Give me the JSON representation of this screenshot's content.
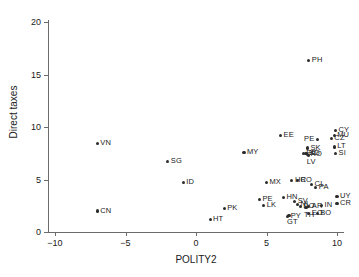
{
  "chart_data": {
    "type": "scatter",
    "title": "",
    "xlabel": "POLITY2",
    "ylabel": "Direct taxes",
    "xlim": [
      -10,
      10
    ],
    "ylim": [
      0,
      20
    ],
    "xticks": [
      "-10",
      "-5",
      "0",
      "5",
      "10"
    ],
    "xtick_values": [
      -10,
      -5,
      0,
      5,
      10
    ],
    "yticks": [
      "0",
      "5",
      "10",
      "15",
      "20"
    ],
    "ytick_values": [
      0,
      5,
      10,
      15,
      20
    ],
    "grid": false,
    "legend": null,
    "marker_color": "#2b2b2b",
    "axis_color": "#6b6b6b",
    "points": [
      {
        "label": "VN",
        "x": -7.0,
        "y": 8.4,
        "lbl": "right"
      },
      {
        "label": "CN",
        "x": -7.0,
        "y": 2.0,
        "lbl": "right"
      },
      {
        "label": "SG",
        "x": -2.0,
        "y": 6.7,
        "lbl": "right"
      },
      {
        "label": "ID",
        "x": -0.9,
        "y": 4.7,
        "lbl": "right"
      },
      {
        "label": "HT",
        "x": 1.0,
        "y": 1.2,
        "lbl": "right"
      },
      {
        "label": "PK",
        "x": 2.0,
        "y": 2.2,
        "lbl": "right"
      },
      {
        "label": "MY",
        "x": 3.4,
        "y": 7.6,
        "lbl": "right"
      },
      {
        "label": "PE",
        "x": 4.5,
        "y": 3.1,
        "lbl": "right"
      },
      {
        "label": "LK",
        "x": 4.8,
        "y": 2.5,
        "lbl": "right"
      },
      {
        "label": "MX",
        "x": 5.0,
        "y": 4.7,
        "lbl": "right"
      },
      {
        "label": "EE",
        "x": 6.0,
        "y": 9.2,
        "lbl": "right"
      },
      {
        "label": "HN",
        "x": 6.2,
        "y": 3.3,
        "lbl": "right"
      },
      {
        "label": "PY",
        "x": 6.5,
        "y": 1.5,
        "lbl": "right"
      },
      {
        "label": "GT",
        "x": 6.6,
        "y": 1.6,
        "lbl": "below"
      },
      {
        "label": "HR",
        "x": 6.8,
        "y": 4.9,
        "lbl": "right"
      },
      {
        "label": "CO",
        "x": 7.2,
        "y": 4.9,
        "lbl": "right"
      },
      {
        "label": "SV",
        "x": 7.0,
        "y": 2.9,
        "lbl": "right"
      },
      {
        "label": "NI",
        "x": 7.2,
        "y": 2.6,
        "lbl": "right"
      },
      {
        "label": "DO",
        "x": 7.4,
        "y": 2.4,
        "lbl": "right"
      },
      {
        "label": "PH",
        "x": 8.0,
        "y": 16.3,
        "lbl": "right"
      },
      {
        "label": "PE2",
        "x": 8.6,
        "y": 8.8,
        "lbl": "left"
      },
      {
        "label": "SK",
        "x": 7.9,
        "y": 8.0,
        "lbl": "right"
      },
      {
        "label": "EC",
        "x": 7.6,
        "y": 7.5,
        "lbl": "right"
      },
      {
        "label": "BG",
        "x": 7.8,
        "y": 7.5,
        "lbl": "right"
      },
      {
        "label": "RO",
        "x": 7.9,
        "y": 7.4,
        "lbl": "right"
      },
      {
        "label": "LV",
        "x": 8.0,
        "y": 7.3,
        "lbl": "below"
      },
      {
        "label": "CL",
        "x": 8.2,
        "y": 4.5,
        "lbl": "right"
      },
      {
        "label": "PA",
        "x": 8.5,
        "y": 4.2,
        "lbl": "right"
      },
      {
        "label": "AR",
        "x": 8.0,
        "y": 2.4,
        "lbl": "right"
      },
      {
        "label": "TH",
        "x": 7.8,
        "y": 2.3,
        "lbl": "below"
      },
      {
        "label": "EO",
        "x": 8.0,
        "y": 1.8,
        "lbl": "right"
      },
      {
        "label": "BO",
        "x": 8.6,
        "y": 1.8,
        "lbl": "right"
      },
      {
        "label": "IN",
        "x": 8.9,
        "y": 2.5,
        "lbl": "right"
      },
      {
        "label": "CZ",
        "x": 9.6,
        "y": 8.9,
        "lbl": "right"
      },
      {
        "label": "MU",
        "x": 9.8,
        "y": 9.2,
        "lbl": "right"
      },
      {
        "label": "CY",
        "x": 9.9,
        "y": 9.7,
        "lbl": "right"
      },
      {
        "label": "LT",
        "x": 9.8,
        "y": 8.1,
        "lbl": "right"
      },
      {
        "label": "SI",
        "x": 9.9,
        "y": 7.5,
        "lbl": "right"
      },
      {
        "label": "UY",
        "x": 10.0,
        "y": 3.4,
        "lbl": "right"
      },
      {
        "label": "CR",
        "x": 10.0,
        "y": 2.7,
        "lbl": "right"
      }
    ]
  }
}
